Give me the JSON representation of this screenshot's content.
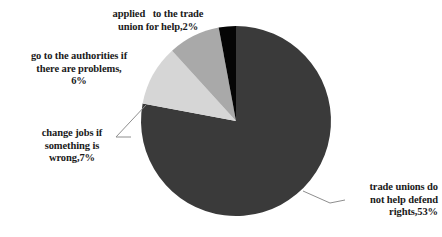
{
  "chart_data": {
    "type": "pie",
    "title": "",
    "subtitle": "",
    "xlabel": "",
    "ylabel": "",
    "legend_position": "none",
    "grid": false,
    "total_shown": 68,
    "categories": [
      "trade unions do not help defend rights",
      "change jobs if something is wrong",
      "go to the authorities if there are problems",
      "applied   to the trade union for help"
    ],
    "values": [
      53,
      7,
      6,
      2
    ],
    "value_suffix": "%",
    "colors": [
      "#3a3a3a",
      "#d6d6d6",
      "#a9a9a9",
      "#050505"
    ],
    "slices": [
      {
        "name": "trade-unions-do-not-help",
        "label_lines": [
          "trade unions do",
          "not help defend",
          "rights,53%"
        ],
        "value": 53,
        "color": "#3a3a3a",
        "start_angle_deg": 0,
        "sweep_deg": 280.6,
        "leader_line": true
      },
      {
        "name": "change-jobs",
        "label_lines": [
          "change jobs if",
          "something is",
          "wrong,7%"
        ],
        "value": 7,
        "color": "#d6d6d6",
        "start_angle_deg": 280.6,
        "sweep_deg": 37.1,
        "leader_line": true
      },
      {
        "name": "go-to-authorities",
        "label_lines": [
          "go to the authorities if",
          "there are problems,",
          "6%"
        ],
        "value": 6,
        "color": "#a9a9a9",
        "start_angle_deg": 317.7,
        "sweep_deg": 31.8,
        "leader_line": false
      },
      {
        "name": "applied-to-trade-union",
        "label_lines": [
          "applied   to the trade",
          "union for help,2%"
        ],
        "value": 2,
        "color": "#050505",
        "start_angle_deg": 349.5,
        "sweep_deg": 10.5,
        "leader_line": false
      }
    ],
    "geometry": {
      "center_x": 236,
      "center_y": 121,
      "radius": 95
    }
  },
  "labels": {
    "applied": "applied   to the trade\nunion for help,2%",
    "authorities": "go to the authorities if\nthere are problems,\n6%",
    "change_jobs": "change jobs if\nsomething is\nwrong,7%",
    "trade_unions": "trade unions do\nnot help defend\nrights,53%"
  }
}
